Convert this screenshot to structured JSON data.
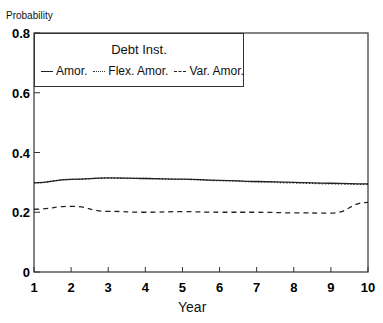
{
  "chart_data": {
    "type": "line",
    "title": "",
    "xlabel": "Year",
    "ylabel": "Probability",
    "x": [
      1,
      2,
      3,
      4,
      5,
      6,
      7,
      8,
      9,
      10
    ],
    "xlim": [
      1,
      10
    ],
    "ylim": [
      0,
      0.8
    ],
    "yticks": [
      "0",
      "0.2",
      "0.4",
      "0.6",
      "0.8"
    ],
    "xticks": [
      "1",
      "2",
      "3",
      "4",
      "5",
      "6",
      "7",
      "8",
      "9",
      "10"
    ],
    "grid": false,
    "legend": {
      "title": "Debt Inst.",
      "position": "upper-left",
      "entries": [
        "Amor.",
        "Flex. Amor.",
        "Var. Amor."
      ]
    },
    "series": [
      {
        "name": "Amor.",
        "style": "solid",
        "values": [
          0.298,
          0.31,
          0.315,
          0.313,
          0.311,
          0.307,
          0.303,
          0.3,
          0.297,
          0.295
        ]
      },
      {
        "name": "Flex. Amor.",
        "style": "dotted",
        "values": [
          0.298,
          0.31,
          0.314,
          0.313,
          0.31,
          0.306,
          0.302,
          0.298,
          0.295,
          0.293
        ]
      },
      {
        "name": "Var. Amor.",
        "style": "dashed",
        "values": [
          0.21,
          0.22,
          0.203,
          0.2,
          0.202,
          0.2,
          0.2,
          0.198,
          0.197,
          0.233
        ]
      }
    ]
  }
}
